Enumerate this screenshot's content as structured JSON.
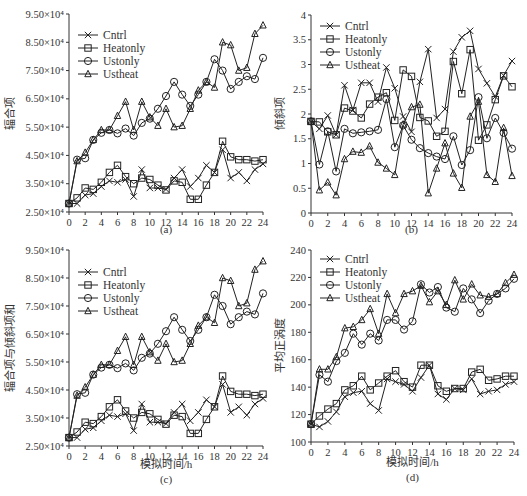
{
  "figure": {
    "panels": [
      "a",
      "b",
      "c",
      "d"
    ]
  },
  "chart_data": [
    {
      "id": "a",
      "type": "line",
      "caption": "(a)",
      "title": "",
      "xlabel": "",
      "ylabel": "辐合项",
      "x": [
        0,
        1,
        2,
        3,
        4,
        5,
        6,
        7,
        8,
        9,
        10,
        11,
        12,
        13,
        14,
        15,
        16,
        17,
        18,
        19,
        20,
        21,
        22,
        23,
        24
      ],
      "xticks": [
        "0",
        "2",
        "4",
        "6",
        "8",
        "10",
        "12",
        "14",
        "16",
        "18",
        "20",
        "22",
        "24"
      ],
      "xlim": [
        0,
        24
      ],
      "ylim": [
        25000,
        95000
      ],
      "yticks": [
        "2.50×10⁴",
        "3.50×10⁴",
        "4.50×10⁴",
        "5.50×10⁴",
        "6.50×10⁴",
        "7.50×10⁴",
        "8.50×10⁴",
        "9.50×10⁴"
      ],
      "legend": [
        "Cntrl",
        "Heatonly",
        "Ustonly",
        "Ustheat"
      ],
      "legend_position": "upper left",
      "grid": false,
      "series": [
        {
          "name": "Cntrl",
          "marker": "x",
          "values": [
            28000,
            28000,
            31000,
            31500,
            34000,
            36000,
            35500,
            36500,
            30500,
            40000,
            33500,
            33500,
            33000,
            37000,
            40000,
            34000,
            37000,
            41500,
            39000,
            47000,
            37000,
            39000,
            36000,
            40000,
            42000
          ]
        },
        {
          "name": "Heatonly",
          "marker": "square",
          "values": [
            28000,
            30000,
            33500,
            33000,
            35500,
            39000,
            41500,
            37500,
            35000,
            37000,
            36500,
            34500,
            32800,
            36000,
            35500,
            29500,
            29500,
            34500,
            39000,
            50000,
            44500,
            43500,
            43500,
            43000,
            43500
          ]
        },
        {
          "name": "Ustonly",
          "marker": "circle",
          "values": [
            28000,
            43500,
            44000,
            50500,
            53000,
            54000,
            52800,
            54500,
            52000,
            56500,
            58000,
            61500,
            66000,
            71000,
            66500,
            62500,
            66500,
            71000,
            79000,
            75000,
            68500,
            71000,
            73000,
            72000,
            79500
          ]
        },
        {
          "name": "Ustheat",
          "marker": "triangle",
          "values": [
            28000,
            43000,
            46000,
            50500,
            54000,
            54000,
            59000,
            64000,
            54000,
            64000,
            58500,
            55500,
            61500,
            55000,
            55500,
            61500,
            68000,
            71000,
            69000,
            85000,
            84000,
            75000,
            76000,
            88000,
            91000
          ]
        }
      ]
    },
    {
      "id": "b",
      "type": "line",
      "caption": "(b)",
      "title": "",
      "xlabel": "",
      "ylabel": "倾斜项",
      "x": [
        0,
        1,
        2,
        3,
        4,
        5,
        6,
        7,
        8,
        9,
        10,
        11,
        12,
        13,
        14,
        15,
        16,
        17,
        18,
        19,
        20,
        21,
        22,
        23,
        24
      ],
      "xticks": [
        "0",
        "2",
        "4",
        "6",
        "8",
        "10",
        "12",
        "14",
        "16",
        "18",
        "20",
        "22",
        "24"
      ],
      "xlim": [
        0,
        24
      ],
      "ylim": [
        0,
        4
      ],
      "yticks": [
        "0",
        "0.5",
        "1",
        "1.5",
        "2",
        "2.5",
        "3",
        "3.5",
        "4"
      ],
      "legend": [
        "Cntrl",
        "Heatonly",
        "Ustonly",
        "Ustheat"
      ],
      "legend_position": "upper left",
      "grid": false,
      "series": [
        {
          "name": "Cntrl",
          "marker": "x",
          "values": [
            1.85,
            1.7,
            1.97,
            1.58,
            2.58,
            2.08,
            2.63,
            2.63,
            2.25,
            2.94,
            2.52,
            1.95,
            1.64,
            2.65,
            3.31,
            1.92,
            2.1,
            3.26,
            3.55,
            3.68,
            2.91,
            2.62,
            2.35,
            2.78,
            3.07
          ]
        },
        {
          "name": "Heatonly",
          "marker": "square",
          "values": [
            1.85,
            1.84,
            1.64,
            1.58,
            2.12,
            2.06,
            1.92,
            2.2,
            2.34,
            2.43,
            1.87,
            2.89,
            2.76,
            1.93,
            1.86,
            1.55,
            1.65,
            3.06,
            2.41,
            3.3,
            1.47,
            1.78,
            2.29,
            2.77,
            2.55
          ]
        },
        {
          "name": "Ustonly",
          "marker": "circle",
          "values": [
            1.85,
            0.98,
            1.65,
            0.84,
            1.7,
            1.61,
            1.63,
            1.65,
            1.68,
            2.3,
            1.33,
            1.77,
            1.48,
            1.31,
            1.21,
            1.14,
            1.09,
            1.55,
            0.97,
            1.27,
            2.34,
            1.51,
            1.92,
            1.62,
            1.3
          ]
        },
        {
          "name": "Ustheat",
          "marker": "triangle",
          "values": [
            1.85,
            0.46,
            0.62,
            0.36,
            1.09,
            1.24,
            1.22,
            1.35,
            1.02,
            0.9,
            0.77,
            1.79,
            2.14,
            2.19,
            0.4,
            0.9,
            1.41,
            0.8,
            0.51,
            1.95,
            2.25,
            0.77,
            0.63,
            1.72,
            0.75
          ]
        }
      ]
    },
    {
      "id": "c",
      "type": "line",
      "caption": "(c)",
      "title": "",
      "xlabel": "模拟时间/h",
      "ylabel": "辐合项与倾斜项和",
      "x": [
        0,
        1,
        2,
        3,
        4,
        5,
        6,
        7,
        8,
        9,
        10,
        11,
        12,
        13,
        14,
        15,
        16,
        17,
        18,
        19,
        20,
        21,
        22,
        23,
        24
      ],
      "xticks": [
        "0",
        "2",
        "4",
        "6",
        "8",
        "10",
        "12",
        "14",
        "16",
        "18",
        "20",
        "22",
        "24"
      ],
      "xlim": [
        0,
        24
      ],
      "ylim": [
        25000,
        95000
      ],
      "yticks": [
        "2.50×10⁴",
        "3.50×10⁴",
        "4.50×10⁴",
        "5.50×10⁴",
        "6.50×10⁴",
        "7.50×10⁴",
        "8.50×10⁴",
        "9.50×10⁴"
      ],
      "legend": [
        "Cntrl",
        "Heatonly",
        "Ustonly",
        "Ustheat"
      ],
      "legend_position": "upper left",
      "grid": false,
      "series": [
        {
          "name": "Cntrl",
          "marker": "x",
          "values": [
            28000,
            28000,
            31000,
            31500,
            34000,
            36000,
            35500,
            36500,
            30500,
            40000,
            33500,
            33500,
            33000,
            37000,
            40000,
            34000,
            37000,
            41500,
            39000,
            47000,
            37000,
            39000,
            36000,
            40000,
            42000
          ]
        },
        {
          "name": "Heatonly",
          "marker": "square",
          "values": [
            28000,
            30000,
            33500,
            33000,
            35500,
            39000,
            41500,
            37500,
            35000,
            37000,
            36500,
            34500,
            32800,
            36000,
            35500,
            29500,
            29500,
            34500,
            39000,
            50000,
            44500,
            43500,
            43500,
            43000,
            43500
          ]
        },
        {
          "name": "Ustonly",
          "marker": "circle",
          "values": [
            28000,
            43500,
            44000,
            50500,
            53000,
            54000,
            52800,
            54500,
            52000,
            56500,
            58000,
            61500,
            66000,
            71000,
            66500,
            62500,
            66500,
            71000,
            79000,
            75000,
            68500,
            71000,
            73000,
            72000,
            79500
          ]
        },
        {
          "name": "Ustheat",
          "marker": "triangle",
          "values": [
            28000,
            43000,
            46000,
            50500,
            54000,
            54000,
            59000,
            64000,
            54000,
            64000,
            58500,
            55500,
            61500,
            55000,
            55500,
            61500,
            68000,
            71000,
            69000,
            85000,
            84000,
            75000,
            76000,
            88000,
            91000
          ]
        }
      ]
    },
    {
      "id": "d",
      "type": "line",
      "caption": "(d)",
      "title": "",
      "xlabel": "模拟时间/h",
      "ylabel": "平均正涡度",
      "x": [
        0,
        1,
        2,
        3,
        4,
        5,
        6,
        7,
        8,
        9,
        10,
        11,
        12,
        13,
        14,
        15,
        16,
        17,
        18,
        19,
        20,
        21,
        22,
        23,
        24
      ],
      "xticks": [
        "0",
        "2",
        "4",
        "6",
        "8",
        "10",
        "12",
        "14",
        "16",
        "18",
        "20",
        "22",
        "24"
      ],
      "xlim": [
        0,
        24
      ],
      "ylim": [
        100,
        240
      ],
      "yticks": [
        "100",
        "120",
        "140",
        "160",
        "180",
        "200",
        "220",
        "240"
      ],
      "legend": [
        "Cntrl",
        "Heatonly",
        "Ustonly",
        "Ustheat"
      ],
      "legend_position": "upper left",
      "grid": false,
      "series": [
        {
          "name": "Cntrl",
          "marker": "x",
          "values": [
            113,
            111,
            115,
            122,
            133,
            136,
            137,
            128,
            123,
            146,
            144,
            142,
            137,
            147,
            156,
            135,
            131,
            139,
            138,
            146,
            135,
            137,
            138,
            142,
            144
          ]
        },
        {
          "name": "Heatonly",
          "marker": "square",
          "values": [
            113,
            119,
            124,
            128,
            138,
            141,
            148,
            138,
            143,
            148,
            152,
            144,
            140,
            156,
            156,
            141,
            137,
            139,
            139,
            151,
            153,
            145,
            146,
            148,
            148
          ]
        },
        {
          "name": "Ustonly",
          "marker": "circle",
          "values": [
            113,
            149,
            144,
            159,
            165,
            179,
            171,
            179,
            174,
            189,
            189,
            182,
            188,
            215,
            209,
            213,
            198,
            195,
            212,
            204,
            194,
            203,
            208,
            212,
            219
          ]
        },
        {
          "name": "Ustheat",
          "marker": "triangle",
          "values": [
            113,
            153,
            153,
            162,
            183,
            184,
            189,
            197,
            179,
            208,
            194,
            208,
            210,
            214,
            202,
            210,
            200,
            218,
            204,
            215,
            207,
            206,
            208,
            216,
            222
          ]
        }
      ]
    }
  ]
}
